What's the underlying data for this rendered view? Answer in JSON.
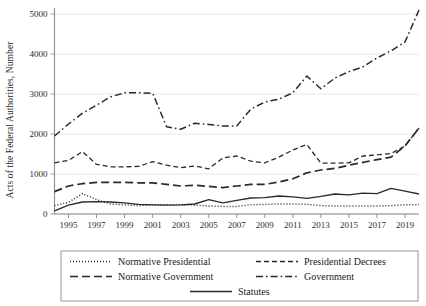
{
  "chart_data": {
    "type": "line",
    "title": "",
    "xlabel": "",
    "ylabel": "Acts of the Federal Authorities, Number",
    "xlim": [
      1994,
      2020
    ],
    "ylim": [
      0,
      5000
    ],
    "yticks": [
      0,
      1000,
      2000,
      3000,
      4000,
      5000
    ],
    "ytick_labels": [
      "0",
      "1000",
      "2000",
      "3000",
      "4000",
      "5000"
    ],
    "xticks": [
      1995,
      1997,
      1999,
      2001,
      2003,
      2005,
      2007,
      2009,
      2011,
      2013,
      2015,
      2017,
      2019
    ],
    "xtick_labels": [
      "1995",
      "1997",
      "1999",
      "2001",
      "2003",
      "2005",
      "2007",
      "2009",
      "2011",
      "2013",
      "2015",
      "2017",
      "2019"
    ],
    "grid": true,
    "legend_position": "below",
    "x": [
      1994,
      1995,
      1996,
      1997,
      1998,
      1999,
      2000,
      2001,
      2002,
      2003,
      2004,
      2005,
      2006,
      2007,
      2008,
      2009,
      2010,
      2011,
      2012,
      2013,
      2014,
      2015,
      2016,
      2017,
      2018,
      2019,
      2020
    ],
    "series": [
      {
        "name": "Government",
        "dash": "dashdot",
        "values": [
          1950,
          2250,
          2520,
          2720,
          2930,
          3030,
          3030,
          3020,
          2180,
          2120,
          2270,
          2240,
          2200,
          2200,
          2620,
          2800,
          2870,
          3030,
          3450,
          3130,
          3400,
          3560,
          3680,
          3900,
          4080,
          4300,
          5100
        ]
      },
      {
        "name": "Presidential Decrees",
        "dash": "dashed",
        "values": [
          1280,
          1340,
          1560,
          1240,
          1180,
          1180,
          1190,
          1310,
          1220,
          1160,
          1200,
          1130,
          1400,
          1450,
          1320,
          1280,
          1420,
          1600,
          1740,
          1270,
          1270,
          1280,
          1450,
          1480,
          1510,
          1700,
          2150
        ]
      },
      {
        "name": "Normative Government",
        "dash": "longdash",
        "values": [
          560,
          700,
          760,
          790,
          790,
          790,
          780,
          780,
          740,
          700,
          720,
          690,
          660,
          700,
          740,
          740,
          800,
          880,
          1030,
          1100,
          1140,
          1220,
          1290,
          1360,
          1420,
          1700,
          2150
        ]
      },
      {
        "name": "Statutes",
        "dash": "solid",
        "values": [
          80,
          220,
          300,
          310,
          300,
          280,
          240,
          230,
          220,
          230,
          250,
          360,
          280,
          340,
          400,
          410,
          450,
          430,
          390,
          440,
          500,
          480,
          520,
          510,
          640,
          570,
          500
        ]
      },
      {
        "name": "Normative Presidential",
        "dash": "dotted",
        "values": [
          210,
          290,
          510,
          360,
          250,
          230,
          210,
          230,
          230,
          230,
          220,
          200,
          190,
          190,
          230,
          240,
          250,
          250,
          240,
          210,
          200,
          200,
          200,
          200,
          210,
          230,
          230
        ]
      }
    ]
  },
  "legend": {
    "items": [
      {
        "label": "Normative Presidential",
        "style": "dotted"
      },
      {
        "label": "Presidential Decrees",
        "style": "dashed"
      },
      {
        "label": "Normative Government",
        "style": "longdash"
      },
      {
        "label": "Government",
        "style": "dashdot"
      },
      {
        "label": "Statutes",
        "style": "solid"
      }
    ]
  }
}
